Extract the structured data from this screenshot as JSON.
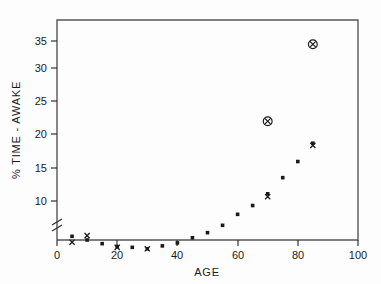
{
  "figure": {
    "background_color": "#fdfdfd",
    "ink_color": "#1a1a1a",
    "caption_fragment": ""
  },
  "chart_data": {
    "type": "scatter",
    "title": "",
    "xlabel": "AGE",
    "ylabel": "% TIME - AWAKE",
    "xlim": [
      0,
      100
    ],
    "ylim": [
      7.5,
      37.5
    ],
    "y_axis_broken": true,
    "y_break_note": "axis break (zigzag) between baseline and first tick",
    "grid": false,
    "legend": "none",
    "xticks": [
      0,
      20,
      40,
      60,
      80,
      100
    ],
    "xtick_labels": [
      "0",
      "20",
      "40",
      "60",
      "80",
      "100"
    ],
    "yticks": [
      10,
      15,
      20,
      25,
      30,
      35
    ],
    "ytick_labels": [
      "10",
      "15",
      "20",
      "25",
      "30",
      "35"
    ],
    "series": [
      {
        "name": "mean-dot",
        "marker": "filled-square-dot",
        "x": [
          5,
          10,
          15,
          20,
          25,
          30,
          35,
          40,
          45,
          50,
          55,
          60,
          65,
          70,
          75,
          80,
          85
        ],
        "y": [
          8.0,
          7.5,
          7.0,
          6.6,
          6.5,
          6.3,
          6.7,
          7.1,
          7.8,
          8.5,
          9.5,
          11.0,
          12.2,
          13.8,
          16.0,
          18.2,
          20.7
        ]
      },
      {
        "name": "x-marker",
        "marker": "x-cross",
        "x": [
          5,
          10,
          20,
          30,
          70,
          85
        ],
        "y": [
          7.2,
          8.1,
          6.5,
          6.3,
          13.4,
          20.4
        ]
      },
      {
        "name": "circled-x",
        "marker": "circle-x",
        "x": [
          70,
          85
        ],
        "y": [
          23.7,
          34.2
        ]
      }
    ]
  },
  "axis_labels": {
    "x": "AGE",
    "y": "% TIME - AWAKE"
  }
}
